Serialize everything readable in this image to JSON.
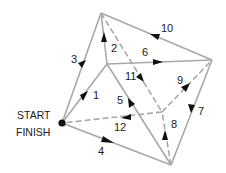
{
  "diagram": {
    "type": "directed-graph",
    "start_label": "START",
    "finish_label": "FINISH",
    "colors": {
      "edge": "#a8a8a8",
      "arrow": "#111111",
      "node": "#111111",
      "text": "#1a1a1a"
    },
    "vertices": {
      "S": [
        62,
        123
      ],
      "T": [
        101,
        13
      ],
      "I": [
        107,
        64
      ],
      "R": [
        212,
        60
      ],
      "C": [
        162,
        112
      ],
      "B": [
        171,
        165
      ]
    },
    "edges": [
      {
        "label": "1",
        "from": "S",
        "to": "I",
        "style": "solid"
      },
      {
        "label": "2",
        "from": "I",
        "to": "T",
        "style": "solid"
      },
      {
        "label": "3",
        "from": "T",
        "to": "S",
        "style": "solid"
      },
      {
        "label": "4",
        "from": "S",
        "to": "B",
        "style": "solid"
      },
      {
        "label": "5",
        "from": "B",
        "to": "I",
        "style": "solid"
      },
      {
        "label": "6",
        "from": "I",
        "to": "R",
        "style": "solid"
      },
      {
        "label": "7",
        "from": "R",
        "to": "B",
        "style": "solid"
      },
      {
        "label": "8",
        "from": "B",
        "to": "C",
        "style": "dashed"
      },
      {
        "label": "9",
        "from": "C",
        "to": "R",
        "style": "dashed"
      },
      {
        "label": "10",
        "from": "R",
        "to": "T",
        "style": "solid"
      },
      {
        "label": "11",
        "from": "T",
        "to": "C",
        "style": "dashed"
      },
      {
        "label": "12",
        "from": "C",
        "to": "S",
        "style": "dashed"
      }
    ]
  }
}
